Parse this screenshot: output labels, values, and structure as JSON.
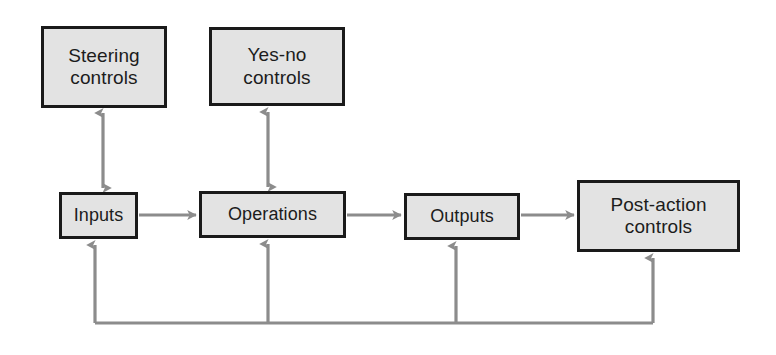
{
  "diagram": {
    "colors": {
      "box_fill": "#e3e3e3",
      "box_border": "#1a1a1a",
      "arrow": "#8c8c8c",
      "background": "#ffffff",
      "text": "#1c1c1c"
    },
    "nodes": [
      {
        "id": "steering-controls",
        "label": "Steering\ncontrols"
      },
      {
        "id": "yes-no-controls",
        "label": "Yes-no\ncontrols"
      },
      {
        "id": "inputs",
        "label": "Inputs"
      },
      {
        "id": "operations",
        "label": "Operations"
      },
      {
        "id": "outputs",
        "label": "Outputs"
      },
      {
        "id": "post-action-controls",
        "label": "Post-action\ncontrols"
      }
    ],
    "connectors": [
      {
        "id": "steering-inputs",
        "from": "steering-controls",
        "to": "inputs",
        "style": "double-arrow",
        "orientation": "vertical"
      },
      {
        "id": "yesno-operations",
        "from": "yes-no-controls",
        "to": "operations",
        "style": "double-arrow",
        "orientation": "vertical"
      },
      {
        "id": "inputs-operations",
        "from": "inputs",
        "to": "operations",
        "style": "single-arrow",
        "orientation": "horizontal"
      },
      {
        "id": "operations-outputs",
        "from": "operations",
        "to": "outputs",
        "style": "single-arrow",
        "orientation": "horizontal"
      },
      {
        "id": "outputs-postaction",
        "from": "outputs",
        "to": "post-action-controls",
        "style": "single-arrow",
        "orientation": "horizontal"
      },
      {
        "id": "feedback-to-inputs",
        "from": "post-action-controls",
        "to": "inputs",
        "style": "feedback-arrow",
        "orientation": "loop"
      },
      {
        "id": "feedback-to-operations",
        "from": "post-action-controls",
        "to": "operations",
        "style": "feedback-arrow",
        "orientation": "loop"
      },
      {
        "id": "feedback-to-outputs",
        "from": "post-action-controls",
        "to": "outputs",
        "style": "feedback-arrow",
        "orientation": "loop"
      },
      {
        "id": "feedback-to-postaction",
        "from": "feedback-line",
        "to": "post-action-controls",
        "style": "feedback-arrow",
        "orientation": "loop"
      }
    ]
  }
}
